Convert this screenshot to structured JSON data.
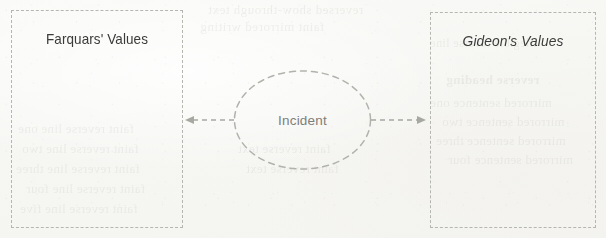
{
  "diagram": {
    "background_color": "#f8f8f6",
    "stroke_color": "#b6b6b1",
    "left_box": {
      "label": "Farquars' Values",
      "style": "dashed-rectangle"
    },
    "right_box": {
      "label": "Gideon's Values",
      "style": "dashed-rectangle-italic-label"
    },
    "center_node": {
      "label": "Incident",
      "style": "dashed-ellipse",
      "text_color": "#7e7e7a"
    },
    "connectors": [
      {
        "id": "left-arrow",
        "direction": "left",
        "style": "dashed",
        "from": "Incident",
        "to": "Farquars' Values"
      },
      {
        "id": "right-arrow",
        "direction": "right",
        "style": "dashed",
        "from": "Incident",
        "to": "Gideon's Values"
      }
    ]
  },
  "showthrough": {
    "top_a": "reversed show-through text",
    "top_b": "faint mirrored writing",
    "top_c": "illegible reverse line",
    "right_heading": "reverse heading",
    "right_a": "mirrored sentence one",
    "right_b": "mirrored sentence two",
    "right_c": "mirrored sentence three",
    "right_d": "mirrored sentence four",
    "left_a": "faint reverse line one",
    "left_b": "faint reverse line two",
    "left_c": "faint reverse line three",
    "left_d": "faint reverse line four",
    "left_e": "faint reverse line five",
    "center_a": "faint reverse text",
    "center_b": "faint reverse text"
  }
}
